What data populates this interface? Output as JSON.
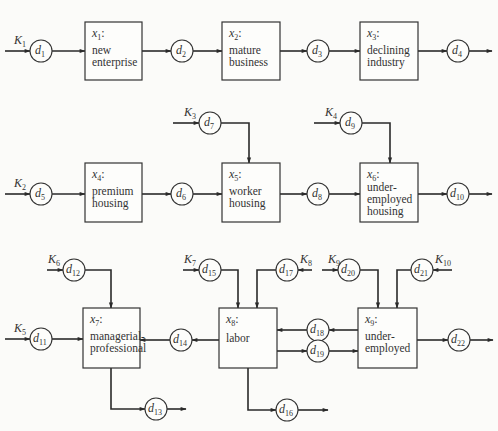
{
  "diagram": {
    "type": "flow diagram",
    "colors": {
      "stroke": "#2a2a2a",
      "background": "#fbfbf9",
      "text": "#333333"
    },
    "boxes": [
      {
        "id": "x1",
        "var": "x",
        "sub": "1",
        "lines": [
          "new",
          "enterprise"
        ],
        "x": 85,
        "y": 22,
        "w": 57,
        "h": 58
      },
      {
        "id": "x2",
        "var": "x",
        "sub": "2",
        "lines": [
          "mature",
          "business"
        ],
        "x": 222,
        "y": 22,
        "w": 58,
        "h": 58
      },
      {
        "id": "x3",
        "var": "x",
        "sub": "3",
        "lines": [
          "declining",
          "industry"
        ],
        "x": 360,
        "y": 22,
        "w": 58,
        "h": 58
      },
      {
        "id": "x4",
        "var": "x",
        "sub": "4",
        "lines": [
          "premium",
          "housing"
        ],
        "x": 85,
        "y": 163,
        "w": 57,
        "h": 59
      },
      {
        "id": "x5",
        "var": "x",
        "sub": "5",
        "lines": [
          "worker",
          "housing"
        ],
        "x": 222,
        "y": 163,
        "w": 58,
        "h": 59
      },
      {
        "id": "x6",
        "var": "x",
        "sub": "6",
        "lines": [
          "under-",
          "employed",
          "housing"
        ],
        "x": 360,
        "y": 163,
        "w": 58,
        "h": 59
      },
      {
        "id": "x7",
        "var": "x",
        "sub": "7",
        "lines": [
          "managerial-",
          "professional"
        ],
        "x": 83,
        "y": 308,
        "w": 57,
        "h": 60
      },
      {
        "id": "x8",
        "var": "x",
        "sub": "8",
        "lines": [
          "labor"
        ],
        "x": 219,
        "y": 308,
        "w": 58,
        "h": 60
      },
      {
        "id": "x9",
        "var": "x",
        "sub": "9",
        "lines": [
          "under-",
          "employed"
        ],
        "x": 358,
        "y": 308,
        "w": 59,
        "h": 60
      }
    ],
    "nodes": [
      {
        "id": "d1",
        "var": "d",
        "sub": "1",
        "cx": 41,
        "cy": 51
      },
      {
        "id": "d2",
        "var": "d",
        "sub": "2",
        "cx": 182,
        "cy": 51
      },
      {
        "id": "d3",
        "var": "d",
        "sub": "3",
        "cx": 318,
        "cy": 51
      },
      {
        "id": "d4",
        "var": "d",
        "sub": "4",
        "cx": 458,
        "cy": 51
      },
      {
        "id": "d5",
        "var": "d",
        "sub": "5",
        "cx": 41,
        "cy": 194
      },
      {
        "id": "d6",
        "var": "d",
        "sub": "6",
        "cx": 182,
        "cy": 194
      },
      {
        "id": "d7",
        "var": "d",
        "sub": "7",
        "cx": 210,
        "cy": 123
      },
      {
        "id": "d8",
        "var": "d",
        "sub": "8",
        "cx": 318,
        "cy": 194
      },
      {
        "id": "d9",
        "var": "d",
        "sub": "9",
        "cx": 351,
        "cy": 123
      },
      {
        "id": "d10",
        "var": "d",
        "sub": "10",
        "cx": 458,
        "cy": 194
      },
      {
        "id": "d11",
        "var": "d",
        "sub": "11",
        "cx": 41,
        "cy": 339
      },
      {
        "id": "d12",
        "var": "d",
        "sub": "12",
        "cx": 74,
        "cy": 270
      },
      {
        "id": "d13",
        "var": "d",
        "sub": "13",
        "cx": 156,
        "cy": 409
      },
      {
        "id": "d14",
        "var": "d",
        "sub": "14",
        "cx": 181,
        "cy": 340
      },
      {
        "id": "d15",
        "var": "d",
        "sub": "15",
        "cx": 210,
        "cy": 270
      },
      {
        "id": "d16",
        "var": "d",
        "sub": "16",
        "cx": 287,
        "cy": 410
      },
      {
        "id": "d17",
        "var": "d",
        "sub": "17",
        "cx": 287,
        "cy": 270
      },
      {
        "id": "d18",
        "var": "d",
        "sub": "18",
        "cx": 318,
        "cy": 330
      },
      {
        "id": "d19",
        "var": "d",
        "sub": "19",
        "cx": 318,
        "cy": 351
      },
      {
        "id": "d20",
        "var": "d",
        "sub": "20",
        "cx": 349,
        "cy": 270
      },
      {
        "id": "d21",
        "var": "d",
        "sub": "21",
        "cx": 422,
        "cy": 270
      },
      {
        "id": "d22",
        "var": "d",
        "sub": "22",
        "cx": 459,
        "cy": 340
      }
    ],
    "inputs": [
      {
        "id": "K1",
        "var": "K",
        "sub": "1",
        "lx": 14,
        "ly": 44,
        "target": "d1"
      },
      {
        "id": "K2",
        "var": "K",
        "sub": "2",
        "lx": 14,
        "ly": 187,
        "target": "d5"
      },
      {
        "id": "K3",
        "var": "K",
        "sub": "3",
        "lx": 184,
        "ly": 116,
        "target": "d7"
      },
      {
        "id": "K4",
        "var": "K",
        "sub": "4",
        "lx": 325,
        "ly": 116,
        "target": "d9"
      },
      {
        "id": "K5",
        "var": "K",
        "sub": "5",
        "lx": 14,
        "ly": 332,
        "target": "d11"
      },
      {
        "id": "K6",
        "var": "K",
        "sub": "6",
        "lx": 48,
        "ly": 263,
        "target": "d12"
      },
      {
        "id": "K7",
        "var": "K",
        "sub": "7",
        "lx": 184,
        "ly": 263,
        "target": "d15"
      },
      {
        "id": "K8",
        "var": "K",
        "sub": "8",
        "lx": 300,
        "ly": 263,
        "target": "d17"
      },
      {
        "id": "K9",
        "var": "K",
        "sub": "9",
        "lx": 328,
        "ly": 263,
        "target": "d20"
      },
      {
        "id": "K10",
        "var": "K",
        "sub": "10",
        "lx": 435,
        "ly": 263,
        "target": "d21"
      }
    ],
    "edges": [
      [
        "K1",
        "d1"
      ],
      [
        "d1",
        "x1"
      ],
      [
        "x1",
        "d2"
      ],
      [
        "d2",
        "x2"
      ],
      [
        "x2",
        "d3"
      ],
      [
        "d3",
        "x3"
      ],
      [
        "x3",
        "d4"
      ],
      [
        "d4",
        "out"
      ],
      [
        "K2",
        "d5"
      ],
      [
        "d5",
        "x4"
      ],
      [
        "x4",
        "d6"
      ],
      [
        "d6",
        "x5"
      ],
      [
        "K3",
        "d7"
      ],
      [
        "d7",
        "x5"
      ],
      [
        "x5",
        "d8"
      ],
      [
        "d8",
        "x6"
      ],
      [
        "K4",
        "d9"
      ],
      [
        "d9",
        "x6"
      ],
      [
        "x6",
        "d10"
      ],
      [
        "d10",
        "out"
      ],
      [
        "K5",
        "d11"
      ],
      [
        "d11",
        "x7"
      ],
      [
        "K6",
        "d12"
      ],
      [
        "d12",
        "x7"
      ],
      [
        "x7",
        "d13"
      ],
      [
        "d13",
        "out"
      ],
      [
        "x8",
        "d14"
      ],
      [
        "d14",
        "x7"
      ],
      [
        "K7",
        "d15"
      ],
      [
        "d15",
        "x8"
      ],
      [
        "K8",
        "d17"
      ],
      [
        "d17",
        "x8"
      ],
      [
        "x8",
        "d16"
      ],
      [
        "d16",
        "out"
      ],
      [
        "x9",
        "d18"
      ],
      [
        "d18",
        "x8"
      ],
      [
        "x8",
        "d19"
      ],
      [
        "d19",
        "x9"
      ],
      [
        "K9",
        "d20"
      ],
      [
        "d20",
        "x9"
      ],
      [
        "K10",
        "d21"
      ],
      [
        "d21",
        "x9"
      ],
      [
        "x9",
        "d22"
      ],
      [
        "d22",
        "out"
      ]
    ]
  }
}
